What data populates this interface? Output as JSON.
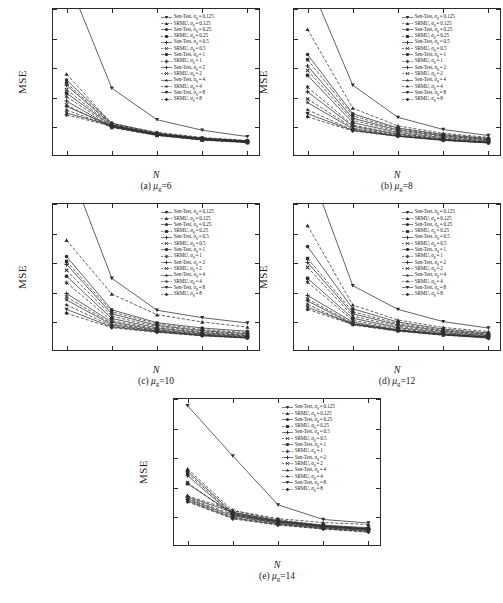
{
  "figure": {
    "axis_label_y": "MSE",
    "axis_label_x": "N"
  },
  "legend_entries": [
    {
      "label": "Sen-Test, σg = 0.125",
      "method": "Sen-Test",
      "sigma": "0.125",
      "marker": "tri-down",
      "dash": "solid"
    },
    {
      "label": "SRMU, σg = 0.125",
      "method": "SRMU",
      "sigma": "0.125",
      "marker": "tri-up",
      "dash": "dashed"
    },
    {
      "label": "Sen-Test, σg = 0.25",
      "method": "Sen-Test",
      "sigma": "0.25",
      "marker": "circle",
      "dash": "solid"
    },
    {
      "label": "SRMU, σg = 0.25",
      "method": "SRMU",
      "sigma": "0.25",
      "marker": "square",
      "dash": "dashed"
    },
    {
      "label": "Sen-Test, σg = 0.5",
      "method": "Sen-Test",
      "sigma": "0.5",
      "marker": "plus",
      "dash": "solid"
    },
    {
      "label": "SRMU, σg = 0.5",
      "method": "SRMU",
      "sigma": "0.5",
      "marker": "x",
      "dash": "dashed"
    },
    {
      "label": "Sen-Test, σg = 1",
      "method": "Sen-Test",
      "sigma": "1",
      "marker": "hex",
      "dash": "solid"
    },
    {
      "label": "SRMU, σg = 1",
      "method": "SRMU",
      "sigma": "1",
      "marker": "star6",
      "dash": "dashed"
    },
    {
      "label": "Sen-Test, σg = 2",
      "method": "Sen-Test",
      "sigma": "2",
      "marker": "plus-bold",
      "dash": "solid"
    },
    {
      "label": "SRMU, σg = 2",
      "method": "SRMU",
      "sigma": "2",
      "marker": "cross",
      "dash": "dashed"
    },
    {
      "label": "Sen-Test, σg = 4",
      "method": "Sen-Test",
      "sigma": "4",
      "marker": "star5",
      "dash": "solid"
    },
    {
      "label": "SRMU, σg = 4",
      "method": "SRMU",
      "sigma": "4",
      "marker": "star5b",
      "dash": "dashed"
    },
    {
      "label": "Sen-Test, σg = 8",
      "method": "Sen-Test",
      "sigma": "8",
      "marker": "tri-down-b",
      "dash": "solid"
    },
    {
      "label": "SRMU, σg = 8",
      "method": "SRMU",
      "sigma": "8",
      "marker": "diamond",
      "dash": "dashed"
    }
  ],
  "captions": {
    "a": "(a) μg=6",
    "b": "(b) μg=8",
    "c": "(c) μg=10",
    "d": "(d) μg=12",
    "e": "(e) μg=14"
  },
  "chart_data": [
    {
      "id": "a",
      "type": "line",
      "title": "(a) μg=6",
      "xlabel": "N",
      "ylabel": "MSE",
      "x": [
        10,
        15,
        20,
        25,
        30
      ],
      "xlim": [
        8.5,
        31.5
      ],
      "ylim": [
        0.0,
        1.0
      ],
      "xticks": [
        10,
        15,
        20,
        25,
        30
      ],
      "yticks": [
        0.0,
        0.2,
        0.4,
        0.6,
        0.8,
        1.0
      ],
      "grid": false,
      "legend_position": "upper-right",
      "series": [
        {
          "name": "Sen-Test, σg = 0.125",
          "values": [
            1.22,
            0.465,
            0.252,
            0.181,
            0.138
          ]
        },
        {
          "name": "SRMU, σg = 0.125",
          "values": [
            0.56,
            0.225,
            0.167,
            0.132,
            0.112
          ]
        },
        {
          "name": "Sen-Test, σg = 0.25",
          "values": [
            0.52,
            0.229,
            0.162,
            0.128,
            0.108
          ]
        },
        {
          "name": "SRMU, σg = 0.25",
          "values": [
            0.5,
            0.222,
            0.159,
            0.125,
            0.105
          ]
        },
        {
          "name": "Sen-Test, σg = 0.5",
          "values": [
            0.485,
            0.218,
            0.156,
            0.123,
            0.104
          ]
        },
        {
          "name": "SRMU, σg = 0.5",
          "values": [
            0.455,
            0.214,
            0.153,
            0.121,
            0.102
          ]
        },
        {
          "name": "Sen-Test, σg = 1",
          "values": [
            0.432,
            0.21,
            0.151,
            0.119,
            0.101
          ]
        },
        {
          "name": "SRMU, σg = 1",
          "values": [
            0.408,
            0.206,
            0.149,
            0.117,
            0.1
          ]
        },
        {
          "name": "Sen-Test, σg = 2",
          "values": [
            0.378,
            0.202,
            0.147,
            0.115,
            0.098
          ]
        },
        {
          "name": "SRMU, σg = 2",
          "values": [
            0.352,
            0.198,
            0.145,
            0.114,
            0.097
          ]
        },
        {
          "name": "Sen-Test, σg = 4",
          "values": [
            0.341,
            0.211,
            0.15,
            0.12,
            0.103
          ]
        },
        {
          "name": "SRMU, σg = 4",
          "values": [
            0.318,
            0.205,
            0.148,
            0.118,
            0.101
          ]
        },
        {
          "name": "Sen-Test, σg = 8",
          "values": [
            0.298,
            0.212,
            0.155,
            0.126,
            0.109
          ]
        },
        {
          "name": "SRMU, σg = 8",
          "values": [
            0.285,
            0.208,
            0.152,
            0.124,
            0.107
          ]
        }
      ]
    },
    {
      "id": "b",
      "type": "line",
      "title": "(b) μg=8",
      "xlabel": "N",
      "ylabel": "MSE",
      "x": [
        10,
        15,
        20,
        25,
        30
      ],
      "xlim": [
        8.5,
        31.5
      ],
      "ylim": [
        0.0,
        1.0
      ],
      "xticks": [
        10,
        15,
        20,
        25,
        30
      ],
      "yticks": [
        0.0,
        0.2,
        0.4,
        0.6,
        0.8,
        1.0
      ],
      "grid": false,
      "legend_position": "upper-right",
      "series": [
        {
          "name": "Sen-Test, σg = 0.125",
          "values": [
            1.21,
            0.485,
            0.268,
            0.186,
            0.145
          ]
        },
        {
          "name": "SRMU, σg = 0.125",
          "values": [
            0.862,
            0.33,
            0.21,
            0.16,
            0.133
          ]
        },
        {
          "name": "Sen-Test, σg = 0.25",
          "values": [
            0.692,
            0.292,
            0.196,
            0.152,
            0.126
          ]
        },
        {
          "name": "SRMU, σg = 0.25",
          "values": [
            0.658,
            0.278,
            0.19,
            0.148,
            0.122
          ]
        },
        {
          "name": "Sen-Test, σg = 0.5",
          "values": [
            0.615,
            0.262,
            0.182,
            0.143,
            0.118
          ]
        },
        {
          "name": "SRMU, σg = 0.5",
          "values": [
            0.585,
            0.248,
            0.175,
            0.138,
            0.114
          ]
        },
        {
          "name": "Sen-Test, σg = 1",
          "values": [
            0.552,
            0.232,
            0.166,
            0.131,
            0.109
          ]
        },
        {
          "name": "SRMU, σg = 1",
          "values": [
            0.472,
            0.216,
            0.158,
            0.125,
            0.104
          ]
        },
        {
          "name": "Sen-Test, σg = 2",
          "values": [
            0.44,
            0.208,
            0.153,
            0.121,
            0.101
          ]
        },
        {
          "name": "SRMU, σg = 2",
          "values": [
            0.392,
            0.198,
            0.147,
            0.117,
            0.098
          ]
        },
        {
          "name": "Sen-Test, σg = 4",
          "values": [
            0.368,
            0.19,
            0.143,
            0.114,
            0.096
          ]
        },
        {
          "name": "SRMU, σg = 4",
          "values": [
            0.318,
            0.182,
            0.14,
            0.112,
            0.094
          ]
        },
        {
          "name": "Sen-Test, σg = 8",
          "values": [
            0.292,
            0.18,
            0.141,
            0.115,
            0.098
          ]
        },
        {
          "name": "SRMU, σg = 8",
          "values": [
            0.272,
            0.176,
            0.139,
            0.113,
            0.096
          ]
        }
      ]
    },
    {
      "id": "c",
      "type": "line",
      "title": "(c) μg=10",
      "xlabel": "N",
      "ylabel": "MSE",
      "x": [
        10,
        15,
        20,
        25,
        30
      ],
      "xlim": [
        8.5,
        31.5
      ],
      "ylim": [
        0.0,
        1.0
      ],
      "xticks": [
        10,
        15,
        20,
        25,
        30
      ],
      "yticks": [
        0.0,
        0.2,
        0.4,
        0.6,
        0.8,
        1.0
      ],
      "grid": false,
      "legend_position": "upper-right",
      "series": [
        {
          "name": "Sen-Test, σg = 0.125",
          "values": [
            1.3,
            0.498,
            0.282,
            0.232,
            0.196
          ]
        },
        {
          "name": "SRMU, σg = 0.125",
          "values": [
            0.755,
            0.392,
            0.252,
            0.203,
            0.168
          ]
        },
        {
          "name": "Sen-Test, σg = 0.25",
          "values": [
            0.645,
            0.285,
            0.198,
            0.162,
            0.14
          ]
        },
        {
          "name": "SRMU, σg = 0.25",
          "values": [
            0.612,
            0.272,
            0.19,
            0.152,
            0.131
          ]
        },
        {
          "name": "Sen-Test, σg = 0.5",
          "values": [
            0.592,
            0.258,
            0.18,
            0.144,
            0.124
          ]
        },
        {
          "name": "SRMU, σg = 0.5",
          "values": [
            0.552,
            0.242,
            0.172,
            0.138,
            0.118
          ]
        },
        {
          "name": "Sen-Test, σg = 1",
          "values": [
            0.512,
            0.226,
            0.163,
            0.131,
            0.112
          ]
        },
        {
          "name": "SRMU, σg = 1",
          "values": [
            0.468,
            0.212,
            0.156,
            0.126,
            0.108
          ]
        },
        {
          "name": "Sen-Test, σg = 2",
          "values": [
            0.395,
            0.202,
            0.15,
            0.121,
            0.104
          ]
        },
        {
          "name": "SRMU, σg = 2",
          "values": [
            0.372,
            0.192,
            0.145,
            0.117,
            0.1
          ]
        },
        {
          "name": "Sen-Test, σg = 4",
          "values": [
            0.352,
            0.184,
            0.141,
            0.114,
            0.098
          ]
        },
        {
          "name": "SRMU, σg = 4",
          "values": [
            0.318,
            0.176,
            0.138,
            0.112,
            0.096
          ]
        },
        {
          "name": "Sen-Test, σg = 8",
          "values": [
            0.288,
            0.17,
            0.136,
            0.111,
            0.095
          ]
        },
        {
          "name": "SRMU, σg = 8",
          "values": [
            0.262,
            0.164,
            0.133,
            0.109,
            0.093
          ]
        }
      ]
    },
    {
      "id": "d",
      "type": "line",
      "title": "(d) μg=12",
      "xlabel": "N",
      "ylabel": "MSE",
      "x": [
        10,
        15,
        20,
        25,
        30
      ],
      "xlim": [
        8.5,
        31.5
      ],
      "ylim": [
        0.0,
        1.0
      ],
      "xticks": [
        10,
        15,
        20,
        25,
        30
      ],
      "yticks": [
        0.0,
        0.2,
        0.4,
        0.6,
        0.8,
        1.0
      ],
      "grid": false,
      "legend_position": "upper-right",
      "series": [
        {
          "name": "Sen-Test, σg = 0.125",
          "values": [
            1.28,
            0.448,
            0.288,
            0.205,
            0.162
          ]
        },
        {
          "name": "SRMU, σg = 0.125",
          "values": [
            0.855,
            0.318,
            0.216,
            0.166,
            0.138
          ]
        },
        {
          "name": "Sen-Test, σg = 0.25",
          "values": [
            0.712,
            0.292,
            0.202,
            0.155,
            0.129
          ]
        },
        {
          "name": "SRMU, σg = 0.25",
          "values": [
            0.632,
            0.272,
            0.192,
            0.148,
            0.124
          ]
        },
        {
          "name": "Sen-Test, σg = 0.5",
          "values": [
            0.605,
            0.258,
            0.183,
            0.142,
            0.119
          ]
        },
        {
          "name": "SRMU, σg = 0.5",
          "values": [
            0.572,
            0.242,
            0.174,
            0.136,
            0.114
          ]
        },
        {
          "name": "Sen-Test, σg = 1",
          "values": [
            0.498,
            0.228,
            0.165,
            0.13,
            0.11
          ]
        },
        {
          "name": "SRMU, σg = 1",
          "values": [
            0.472,
            0.214,
            0.158,
            0.125,
            0.106
          ]
        },
        {
          "name": "Sen-Test, σg = 2",
          "values": [
            0.382,
            0.202,
            0.15,
            0.12,
            0.102
          ]
        },
        {
          "name": "SRMU, σg = 2",
          "values": [
            0.358,
            0.194,
            0.146,
            0.117,
            0.099
          ]
        },
        {
          "name": "Sen-Test, σg = 4",
          "values": [
            0.345,
            0.188,
            0.143,
            0.115,
            0.098
          ]
        },
        {
          "name": "SRMU, σg = 4",
          "values": [
            0.322,
            0.182,
            0.14,
            0.113,
            0.096
          ]
        },
        {
          "name": "Sen-Test, σg = 8",
          "values": [
            0.302,
            0.19,
            0.148,
            0.12,
            0.102
          ]
        },
        {
          "name": "SRMU, σg = 8",
          "values": [
            0.288,
            0.186,
            0.145,
            0.118,
            0.092
          ]
        }
      ]
    },
    {
      "id": "e",
      "type": "line",
      "title": "(e) μg=14",
      "xlabel": "N",
      "ylabel": "MSE",
      "x": [
        10,
        15,
        20,
        25,
        30
      ],
      "xlim": [
        8.5,
        31.5
      ],
      "ylim": [
        0.0,
        1.0
      ],
      "xticks": [
        10,
        15,
        20,
        25,
        30
      ],
      "yticks": [
        0.0,
        0.2,
        0.4,
        0.6,
        0.8,
        1.0
      ],
      "grid": false,
      "legend_position": "upper-right",
      "series": [
        {
          "name": "Sen-Test, σg = 0.125",
          "values": [
            0.955,
            0.615,
            0.285,
            0.186,
            0.162
          ]
        },
        {
          "name": "SRMU, σg = 0.125",
          "values": [
            0.528,
            0.245,
            0.192,
            0.165,
            0.152
          ]
        },
        {
          "name": "Sen-Test, σg = 0.25",
          "values": [
            0.512,
            0.232,
            0.178,
            0.148,
            0.13
          ]
        },
        {
          "name": "SRMU, σg = 0.25",
          "values": [
            0.498,
            0.225,
            0.172,
            0.142,
            0.124
          ]
        },
        {
          "name": "Sen-Test, σg = 0.5",
          "values": [
            0.482,
            0.218,
            0.168,
            0.138,
            0.12
          ]
        },
        {
          "name": "SRMU, σg = 0.5",
          "values": [
            0.435,
            0.212,
            0.164,
            0.134,
            0.116
          ]
        },
        {
          "name": "Sen-Test, σg = 1",
          "values": [
            0.428,
            0.226,
            0.172,
            0.14,
            0.121
          ]
        },
        {
          "name": "SRMU, σg = 1",
          "values": [
            0.345,
            0.248,
            0.185,
            0.146,
            0.126
          ]
        },
        {
          "name": "Sen-Test, σg = 2",
          "values": [
            0.338,
            0.236,
            0.178,
            0.142,
            0.122
          ]
        },
        {
          "name": "SRMU, σg = 2",
          "values": [
            0.332,
            0.22,
            0.168,
            0.136,
            0.116
          ]
        },
        {
          "name": "Sen-Test, σg = 4",
          "values": [
            0.325,
            0.21,
            0.16,
            0.13,
            0.112
          ]
        },
        {
          "name": "SRMU, σg = 4",
          "values": [
            0.318,
            0.202,
            0.156,
            0.127,
            0.108
          ]
        },
        {
          "name": "Sen-Test, σg = 8",
          "values": [
            0.312,
            0.196,
            0.152,
            0.124,
            0.104
          ]
        },
        {
          "name": "SRMU, σg = 8",
          "values": [
            0.305,
            0.19,
            0.148,
            0.121,
            0.1
          ]
        }
      ]
    }
  ]
}
